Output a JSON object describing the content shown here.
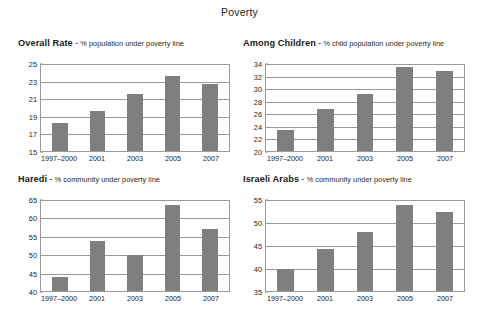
{
  "figure": {
    "title": "Poverty",
    "bar_color": "#7f7f7f",
    "grid_color": "#9a9a9a",
    "background": "#ffffff"
  },
  "chart_data": [
    {
      "type": "bar",
      "panel": "top-left",
      "name": "Overall Rate",
      "dash": "-",
      "description": "% population under poverty line",
      "title": "Overall Rate - % population under poverty line",
      "categories": [
        "1997–2000",
        "2001",
        "2003",
        "2005",
        "2007"
      ],
      "values": [
        18.2,
        19.6,
        21.6,
        23.7,
        22.8
      ],
      "xlabel": "",
      "ylabel": "",
      "ylim": [
        15,
        25
      ],
      "yticks": [
        15,
        17,
        19,
        21,
        23,
        25
      ],
      "grid": true,
      "legend": "none"
    },
    {
      "type": "bar",
      "panel": "top-right",
      "name": "Among Children",
      "dash": "-",
      "description": "% child population under poverty line",
      "title": "Among Children - % child population under poverty line",
      "categories": [
        "1997–2000",
        "2001",
        "2003",
        "2005",
        "2007"
      ],
      "values": [
        23.5,
        26.9,
        29.3,
        33.6,
        33.1
      ],
      "xlabel": "",
      "ylabel": "",
      "ylim": [
        20,
        34
      ],
      "yticks": [
        20,
        22,
        24,
        26,
        28,
        30,
        32,
        34
      ],
      "grid": true,
      "legend": "none"
    },
    {
      "type": "bar",
      "panel": "bottom-left",
      "name": "Haredi",
      "dash": "-",
      "description": "% community under poverty line",
      "title": "Haredi - % community under poverty line",
      "categories": [
        "1997–2000",
        "2001",
        "2003",
        "2005",
        "2007"
      ],
      "values": [
        44.0,
        54.0,
        50.0,
        64.0,
        57.3
      ],
      "xlabel": "",
      "ylabel": "",
      "ylim": [
        40,
        65
      ],
      "yticks": [
        40,
        45,
        50,
        55,
        60,
        65
      ],
      "grid": true,
      "legend": "none"
    },
    {
      "type": "bar",
      "panel": "bottom-right",
      "name": "Israeli Arabs",
      "dash": "-",
      "description": "% community under poverty line",
      "title": "Israeli Arabs - % community under poverty line",
      "categories": [
        "1997–2000",
        "2001",
        "2003",
        "2005",
        "2007"
      ],
      "values": [
        40.0,
        44.3,
        48.2,
        54.2,
        52.6
      ],
      "xlabel": "",
      "ylabel": "",
      "ylim": [
        35,
        55
      ],
      "yticks": [
        35,
        40,
        45,
        50,
        55
      ],
      "grid": true,
      "legend": "none"
    }
  ]
}
